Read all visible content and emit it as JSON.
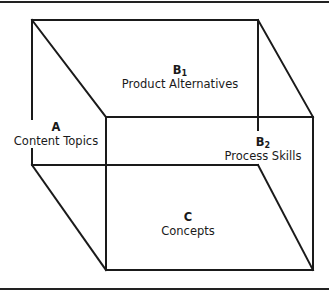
{
  "diagram": {
    "type": "cube",
    "faces": [
      {
        "id": "A",
        "letter": "A",
        "subscript": "",
        "name": "Content Topics",
        "position": "left"
      },
      {
        "id": "B1",
        "letter": "B",
        "subscript": "1",
        "name": "Product Alternatives",
        "position": "top"
      },
      {
        "id": "B2",
        "letter": "B",
        "subscript": "2",
        "name": "Process Skills",
        "position": "right"
      },
      {
        "id": "C",
        "letter": "C",
        "subscript": "",
        "name": "Concepts",
        "position": "front"
      }
    ],
    "line_color": "#1a1a1a"
  }
}
